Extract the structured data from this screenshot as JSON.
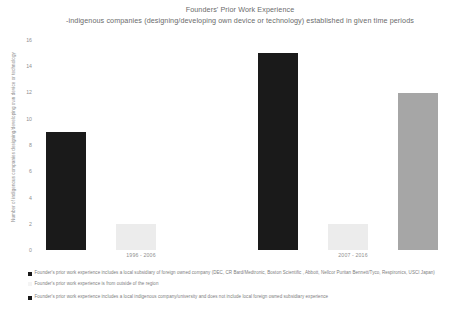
{
  "chart_data": {
    "type": "bar",
    "title": "Founders' Prior Work Experience -indigenous companies (designing/developing own device or technology) established in given time periods",
    "title_line1": "Founders' Prior Work Experience",
    "title_line2": "-indigenous companies (designing/developing own device or technology) established in given time periods",
    "xlabel": "",
    "ylabel": "Number of indigenous companies designing/developing own device or technology",
    "categories": [
      "1996 - 2006",
      "2007 - 2016"
    ],
    "series": [
      {
        "name": "Founder's prior work experience includes a local subsidiary of foreign owned company (DEC, CR Bard/Medtronic, Boston Scientific , Abbott, Nellcor Puritan Bennett/Tyco, Respironics, USCI Japan)",
        "color": "#1a1a1a",
        "values": [
          9,
          15
        ]
      },
      {
        "name": "Founder's prior work experience is from outside of the region",
        "color": "#ececec",
        "values": [
          2,
          2
        ]
      },
      {
        "name": "Founder's prior work experience includes a local indigenous company/university and does not include local foreign owned subsidiary experience",
        "color": "#a6a6a6",
        "values": [
          0,
          12
        ]
      }
    ],
    "ylim": [
      0,
      16
    ],
    "ytick_step": 2,
    "yticks": [
      "16",
      "14",
      "12",
      "10",
      "8",
      "6",
      "4",
      "2",
      "0"
    ],
    "grid": false,
    "legend_position": "bottom"
  },
  "legend": {
    "entries": [
      {
        "swatch_color": "#1a1a1a",
        "marker": "square",
        "label": "Founder's prior work experience includes a local subsidiary of foreign owned company (DEC, CR Bard/Medtronic, Boston Scientific , Abbott, Nellcor Puritan Bennett/Tyco, Respironics, USCI Japan)"
      },
      {
        "swatch_color": "#f4f4f4",
        "marker": "square",
        "label": "Founder's prior work experience is from outside of the region"
      },
      {
        "swatch_color": "#1a1a1a",
        "marker": "square",
        "label": "Founder's prior work experience includes a local indigenous company/university and does not include local foreign owned subsidiary experience"
      }
    ]
  }
}
